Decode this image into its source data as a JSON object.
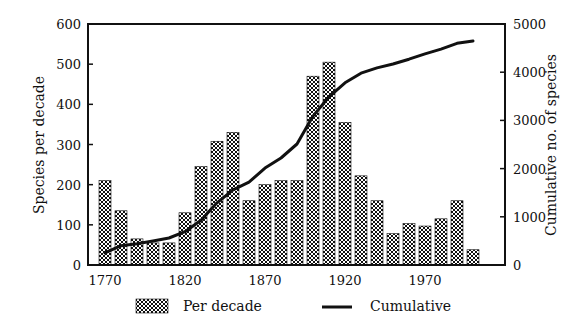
{
  "chart_data": {
    "type": "bar",
    "title": "",
    "xlabel": "",
    "ylabel": "Species per decade",
    "y2label": "Cumulative no. of species",
    "categories": [
      1770,
      1780,
      1790,
      1800,
      1810,
      1820,
      1830,
      1840,
      1850,
      1860,
      1870,
      1880,
      1890,
      1900,
      1910,
      1920,
      1930,
      1940,
      1950,
      1960,
      1970,
      1980,
      1990,
      2000
    ],
    "x_tick_labels": [
      "1770",
      "1820",
      "1870",
      "1920",
      "1970"
    ],
    "ylim": [
      0,
      600
    ],
    "y_ticks": [
      0,
      100,
      200,
      300,
      400,
      500,
      600
    ],
    "y2lim": [
      0,
      5000
    ],
    "y2_ticks": [
      0,
      1000,
      2000,
      3000,
      4000,
      5000
    ],
    "grid": false,
    "legend_position": "bottom",
    "series": [
      {
        "name": "Per decade",
        "type": "bar",
        "axis": "left",
        "pattern": "crosshatch",
        "values": [
          210,
          135,
          65,
          55,
          55,
          130,
          245,
          308,
          330,
          160,
          200,
          210,
          210,
          470,
          505,
          355,
          222,
          160,
          78,
          103,
          97,
          115,
          160,
          38
        ]
      },
      {
        "name": "Cumulative",
        "type": "line",
        "axis": "right",
        "color": "#111111",
        "values": [
          250,
          400,
          440,
          500,
          560,
          690,
          930,
          1290,
          1560,
          1720,
          2010,
          2220,
          2510,
          3090,
          3490,
          3780,
          3980,
          4090,
          4170,
          4270,
          4380,
          4480,
          4600,
          4650
        ]
      }
    ]
  },
  "legend": {
    "per_decade": "Per decade",
    "cumulative": "Cumulative"
  }
}
